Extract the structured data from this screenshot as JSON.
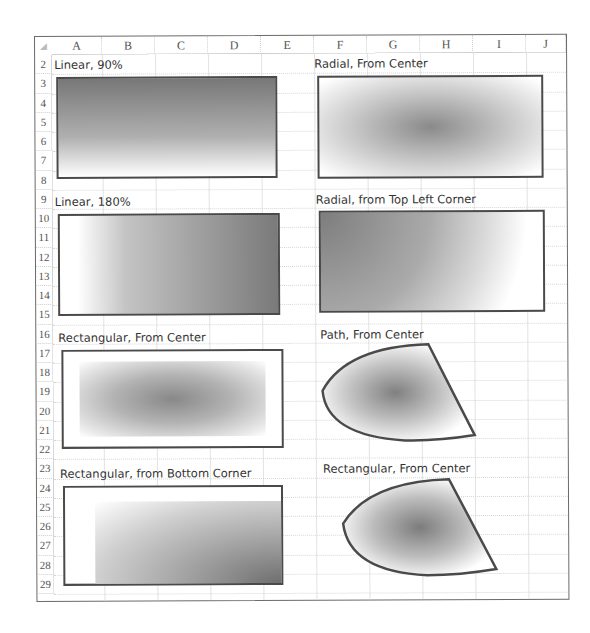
{
  "spreadsheet": {
    "columns": [
      "A",
      "B",
      "C",
      "D",
      "E",
      "F",
      "G",
      "H",
      "I",
      "J"
    ],
    "rows": [
      "2",
      "3",
      "4",
      "5",
      "6",
      "7",
      "8",
      "9",
      "10",
      "11",
      "12",
      "13",
      "14",
      "15",
      "16",
      "17",
      "18",
      "19",
      "20",
      "21",
      "22",
      "23",
      "24",
      "25",
      "26",
      "27",
      "28",
      "29"
    ]
  },
  "shapes": [
    {
      "label": "Linear, 90%",
      "type": "rectangle",
      "gradient": "linear-vertical"
    },
    {
      "label": "Radial, From Center",
      "type": "rectangle",
      "gradient": "radial-center"
    },
    {
      "label": "Linear, 180%",
      "type": "rectangle",
      "gradient": "linear-horizontal"
    },
    {
      "label": "Radial, from Top Left Corner",
      "type": "rectangle",
      "gradient": "radial-top-left"
    },
    {
      "label": "Rectangular, From Center",
      "type": "rectangle",
      "gradient": "rectangular-center"
    },
    {
      "label": "Path, From Center",
      "type": "freeform",
      "gradient": "path-center"
    },
    {
      "label": "Rectangular, from Bottom Corner",
      "type": "rectangle",
      "gradient": "rectangular-bottom-corner"
    },
    {
      "label": "Rectangular, From Center",
      "type": "freeform",
      "gradient": "rectangular-center"
    }
  ],
  "colors": {
    "border": "#4a4a4a",
    "dark_fill": "#7a7a7a",
    "light_fill": "#ffffff",
    "grid": "#e2e2e2"
  }
}
